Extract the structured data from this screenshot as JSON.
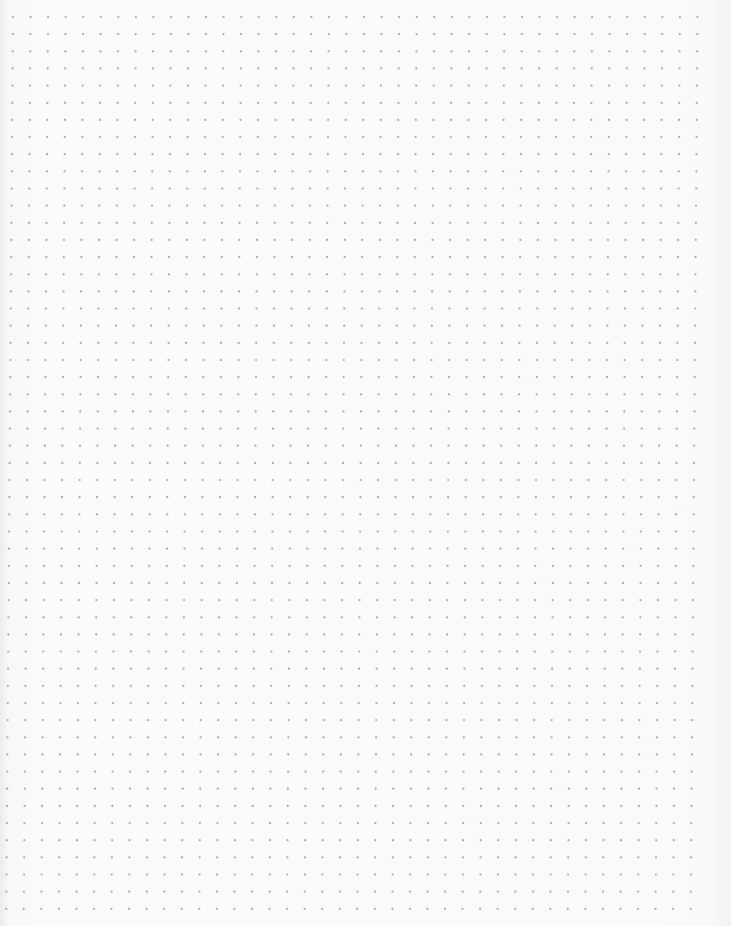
{
  "page": {
    "type": "dot-grid paper",
    "background_color": "#fafafa",
    "dot_color": "#a6a6a6",
    "dot_radius_px": 1.1,
    "grid": {
      "origin_x": 13,
      "origin_y": 17,
      "spacing_x": 17.55,
      "spacing_y": 17.15,
      "columns": 40,
      "rows": 53,
      "skew_x_per_row": -0.13
    }
  }
}
